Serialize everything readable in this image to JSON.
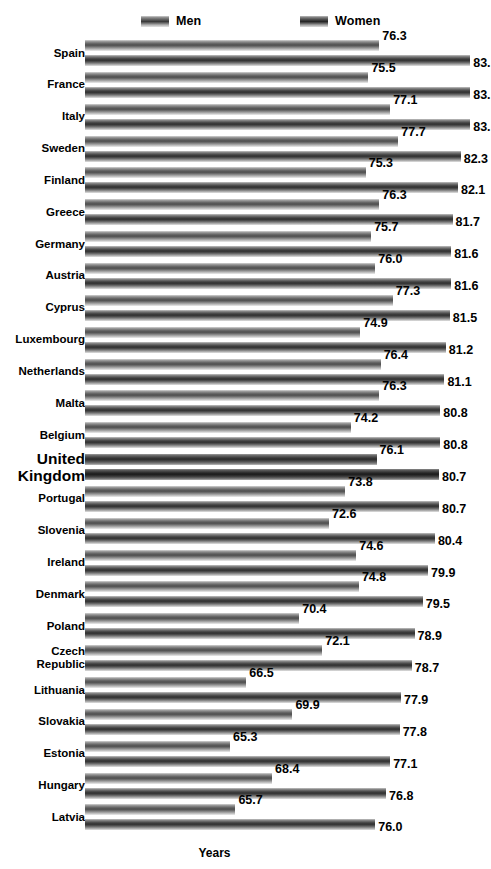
{
  "legend": {
    "items": [
      {
        "key": "men",
        "label": "Men"
      },
      {
        "key": "women",
        "label": "Women"
      }
    ]
  },
  "axis": {
    "xlabel": "Years"
  },
  "highlight_category": "United Kingdom",
  "chart_data": {
    "type": "bar",
    "orientation": "horizontal",
    "title": "",
    "subtitle": "",
    "xlabel": "Years",
    "ylabel": "",
    "grid": false,
    "legend_position": "top",
    "xlim": [
      0,
      90
    ],
    "categories": [
      "Spain",
      "France",
      "Italy",
      "Sweden",
      "Finland",
      "Greece",
      "Germany",
      "Austria",
      "Cyprus",
      "Luxembourg",
      "Netherlands",
      "Malta",
      "Belgium",
      "United Kingdom",
      "Portugal",
      "Slovenia",
      "Ireland",
      "Denmark",
      "Poland",
      "Czech Republic",
      "Lithuania",
      "Slovakia",
      "Estonia",
      "Hungary",
      "Latvia"
    ],
    "series": [
      {
        "name": "Men",
        "values": [
          76.3,
          75.5,
          77.1,
          77.7,
          75.3,
          76.3,
          75.7,
          76.0,
          77.3,
          74.9,
          76.4,
          76.3,
          74.2,
          76.1,
          73.8,
          72.6,
          74.6,
          74.8,
          70.4,
          72.1,
          66.5,
          69.9,
          65.3,
          68.4,
          65.7
        ],
        "labels": [
          "76.3",
          "75.5",
          "77.1",
          "77.7",
          "75.3",
          "76.3",
          "75.7",
          "76.0",
          "77.3",
          "74.9",
          "76.4",
          "76.3",
          "74.2",
          "76.1",
          "73.8",
          "72.6",
          "74.6",
          "74.8",
          "70.4",
          "72.1",
          "66.5",
          "69.9",
          "65.3",
          "68.4",
          "65.7"
        ]
      },
      {
        "name": "Women",
        "values": [
          83.0,
          83.0,
          83.0,
          82.3,
          82.1,
          81.7,
          81.6,
          81.6,
          81.5,
          81.2,
          81.1,
          80.8,
          80.8,
          80.7,
          80.7,
          80.4,
          79.9,
          79.5,
          78.9,
          78.7,
          77.9,
          77.8,
          77.1,
          76.8,
          76.0
        ],
        "labels": [
          "83.",
          "83.",
          "83.",
          "82.3",
          "82.1",
          "81.7",
          "81.6",
          "81.6",
          "81.5",
          "81.2",
          "81.1",
          "80.8",
          "80.8",
          "80.7",
          "80.7",
          "80.4",
          "79.9",
          "79.5",
          "78.9",
          "78.7",
          "77.9",
          "77.8",
          "77.1",
          "76.8",
          "76.0"
        ]
      }
    ]
  }
}
